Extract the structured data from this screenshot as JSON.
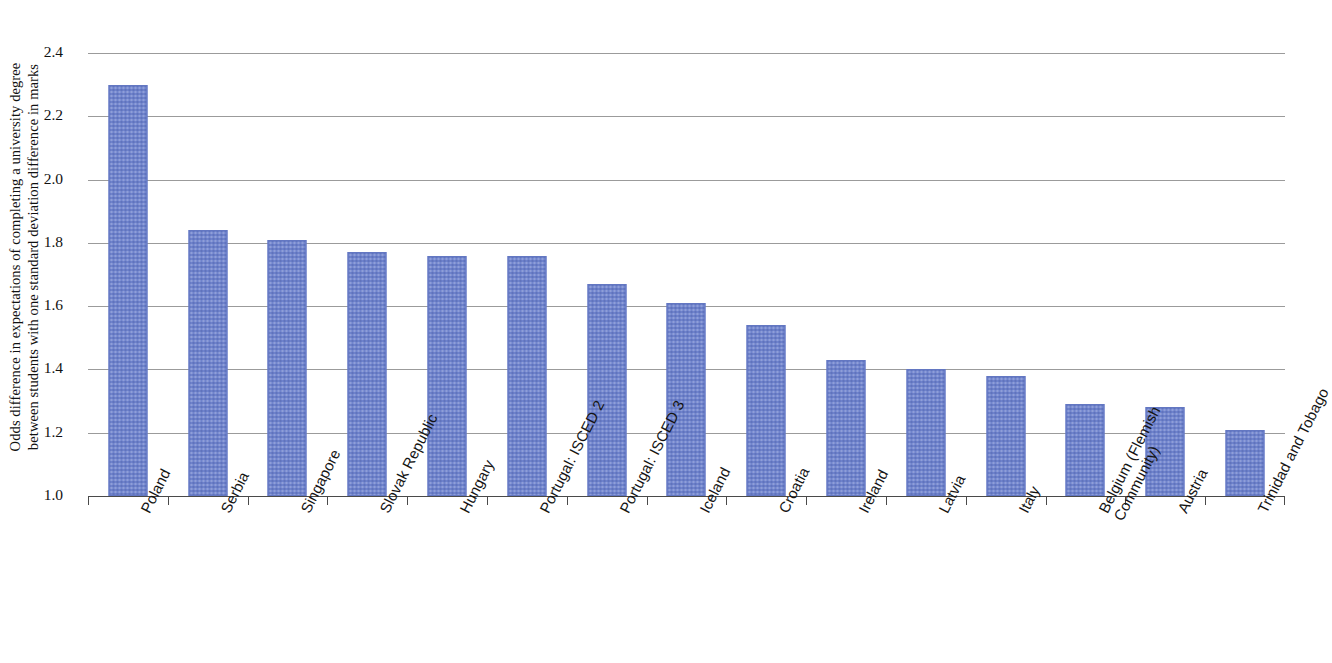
{
  "chart_data": {
    "type": "bar",
    "title": "",
    "xlabel": "",
    "ylabel": "Odds difference in expectations of completing a university degree between students with one standard deviation difference in marks",
    "ylabel_line1": "Odds difference in expectations of completing a university degree",
    "ylabel_line2": "between students with one standard deviation difference in marks",
    "ylim": [
      1.0,
      2.4
    ],
    "ytick_labels": [
      "2.4",
      "2.2",
      "2.0",
      "1.8",
      "1.6",
      "1.4",
      "1.2",
      "1.0"
    ],
    "ytick_values": [
      2.4,
      2.2,
      2.0,
      1.8,
      1.6,
      1.4,
      1.2,
      1.0
    ],
    "grid": true,
    "legend": "none",
    "bar_color": "#6f83cd",
    "gridline_color": "#9b9b9b",
    "axis_color": "#4a4a4a",
    "categories": [
      "Poland",
      "Serbia",
      "Singapore",
      "Slovak Republic",
      "Hungary",
      "Portugal: ISCED 2",
      "Portugal: ISCED 3",
      "Iceland",
      "Croatia",
      "Ireland",
      "Latvia",
      "Italy",
      "Belgium (Flemish Community)",
      "Austria",
      "Trinidad and Tobago"
    ],
    "category_lines": [
      [
        "Poland"
      ],
      [
        "Serbia"
      ],
      [
        "Singapore"
      ],
      [
        "Slovak Republic"
      ],
      [
        "Hungary"
      ],
      [
        "Portugal: ISCED 2"
      ],
      [
        "Portugal: ISCED 3"
      ],
      [
        "Iceland"
      ],
      [
        "Croatia"
      ],
      [
        "Ireland"
      ],
      [
        "Latvia"
      ],
      [
        "Italy"
      ],
      [
        "Belgium (Flemish",
        "Community)"
      ],
      [
        "Austria"
      ],
      [
        "Trinidad and Tobago"
      ]
    ],
    "values": [
      2.3,
      1.84,
      1.81,
      1.77,
      1.76,
      1.76,
      1.67,
      1.61,
      1.54,
      1.43,
      1.4,
      1.38,
      1.29,
      1.28,
      1.21
    ]
  }
}
